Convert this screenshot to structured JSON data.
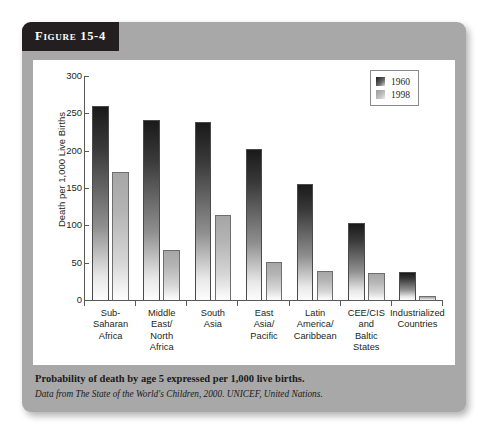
{
  "figure": {
    "banner_label": "Figure 15-4",
    "caption_main": "Probability of death by age 5 expressed per 1,000 live births.",
    "caption_source": "Data from The State of the World's Children, 2000. UNICEF, United Nations.",
    "card_color": "#a8a8a8",
    "banner_color": "#231f20",
    "panel_color": "#ffffff"
  },
  "chart_data": {
    "type": "bar",
    "title": "",
    "xlabel": "",
    "ylabel": "Death per 1,000 Live Births",
    "ylim": [
      0,
      300
    ],
    "yticks": [
      0,
      50,
      100,
      150,
      200,
      250,
      300
    ],
    "ytick_labels": [
      "0",
      "50",
      "100",
      "150",
      "200",
      "250",
      "300"
    ],
    "grid": false,
    "legend_position": "top-right",
    "categories": [
      "Sub-\nSaharan\nAfrica",
      "Middle\nEast/\nNorth\nAfrica",
      "South\nAsia",
      "East\nAsia/\nPacific",
      "Latin\nAmerica/\nCaribbean",
      "CEE/CIS\nand\nBaltic\nStates",
      "Industrialized\nCountries"
    ],
    "series": [
      {
        "name": "1960",
        "color": "#1a1a1a",
        "values": [
          260,
          241,
          238,
          202,
          155,
          103,
          37
        ]
      },
      {
        "name": "1998",
        "color": "#b4b4b4",
        "values": [
          172,
          67,
          114,
          51,
          39,
          36,
          6
        ]
      }
    ]
  }
}
